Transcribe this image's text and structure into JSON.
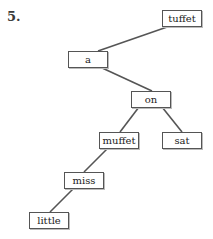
{
  "diagram": {
    "label": "5.",
    "nodes": [
      {
        "id": "tuffet",
        "label": "tuffet",
        "x": 162,
        "y": 10
      },
      {
        "id": "a",
        "label": "a",
        "x": 68,
        "y": 51
      },
      {
        "id": "on",
        "label": "on",
        "x": 131,
        "y": 91
      },
      {
        "id": "muffet",
        "label": "muffet",
        "x": 99,
        "y": 132
      },
      {
        "id": "sat",
        "label": "sat",
        "x": 162,
        "y": 132
      },
      {
        "id": "miss",
        "label": "miss",
        "x": 64,
        "y": 172
      },
      {
        "id": "little",
        "label": "little",
        "x": 29,
        "y": 212
      }
    ],
    "edges": [
      {
        "from": "tuffet",
        "to": "a"
      },
      {
        "from": "a",
        "to": "on"
      },
      {
        "from": "on",
        "to": "muffet"
      },
      {
        "from": "on",
        "to": "sat"
      },
      {
        "from": "muffet",
        "to": "miss"
      },
      {
        "from": "miss",
        "to": "little"
      }
    ],
    "colors": {
      "edge": "#555555",
      "border": "#555555",
      "text": "#222222"
    }
  }
}
